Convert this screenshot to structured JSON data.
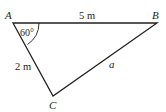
{
  "diagram": {
    "type": "triangle",
    "vertices": {
      "A": {
        "label": "A"
      },
      "B": {
        "label": "B"
      },
      "C": {
        "label": "C"
      }
    },
    "sides": {
      "AB": {
        "label": "5 m"
      },
      "AC": {
        "label": "2 m"
      },
      "BC": {
        "label": "a"
      }
    },
    "angles": {
      "A": {
        "label": "60°"
      }
    },
    "colors": {
      "stroke": "#231f20",
      "background": "#ffffff"
    }
  }
}
